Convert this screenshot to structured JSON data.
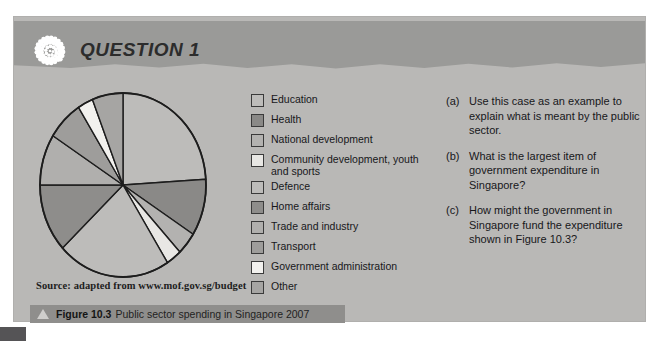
{
  "header": {
    "title": "QUESTION 1",
    "icon": "spiral-dots-icon"
  },
  "source": {
    "text": "Source: adapted from www.mof.gov.sg/budget"
  },
  "caption": {
    "triangle_icon": "triangle-up-icon",
    "figure_number": "Figure 10.3",
    "text": "Public sector spending in Singapore 2007"
  },
  "legend": {
    "items": [
      {
        "label": "Education",
        "color": "#bdbcba"
      },
      {
        "label": "Health",
        "color": "#8a8987"
      },
      {
        "label": "National development",
        "color": "#b3b2b0"
      },
      {
        "label": "Community development, youth and sports",
        "color": "#e8e7e4"
      },
      {
        "label": "Defence",
        "color": "#bdbcba"
      },
      {
        "label": "Home affairs",
        "color": "#8e8d8b"
      },
      {
        "label": "Trade and industry",
        "color": "#b0afad"
      },
      {
        "label": "Transport",
        "color": "#9e9d9b"
      },
      {
        "label": "Government administration",
        "color": "#f2f1ee"
      },
      {
        "label": "Other",
        "color": "#a6a5a3"
      }
    ]
  },
  "questions": {
    "items": [
      {
        "marker": "(a)",
        "text": "Use this case as an example to explain what is meant by the public sector."
      },
      {
        "marker": "(b)",
        "text": "What is the largest item of government expenditure in Singapore?"
      },
      {
        "marker": "(c)",
        "text": "How might the government in Singapore fund the expenditure shown in Figure 10.3?"
      }
    ]
  },
  "chart_data": {
    "type": "pie",
    "title": "Public sector spending in Singapore 2007",
    "source": "adapted from www.mof.gov.sg/budget",
    "legend_position": "right-of-chart",
    "start_angle_deg": 0,
    "direction": "clockwise",
    "categories": [
      "Education",
      "Health",
      "National development",
      "Community development, youth and sports",
      "Defence",
      "Home affairs",
      "Trade and industry",
      "Transport",
      "Government administration",
      "Other"
    ],
    "values": [
      24,
      10,
      4,
      3,
      22,
      12,
      9,
      7,
      3,
      6
    ],
    "unit": "percent",
    "colors": [
      "#bdbcba",
      "#8a8987",
      "#b3b2b0",
      "#e8e7e4",
      "#bdbcba",
      "#8e8d8b",
      "#b0afad",
      "#9e9d9b",
      "#f2f1ee",
      "#a6a5a3"
    ]
  },
  "theme": {
    "panel_bg": "#b9b8b6",
    "header_bg": "#9a9a98",
    "caption_bg": "#8f8e8c",
    "text": "#17171a",
    "outline": "#1d1d1d"
  }
}
